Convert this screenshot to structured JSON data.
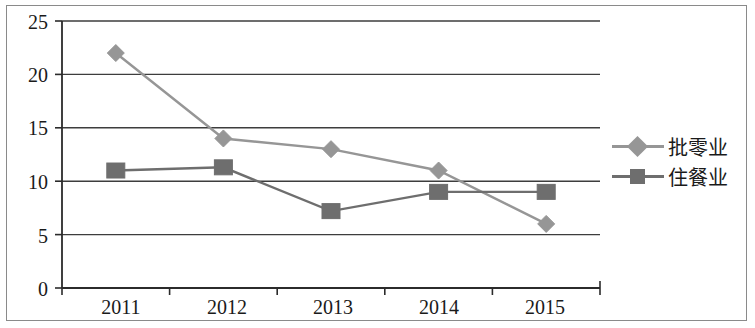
{
  "chart_data": {
    "type": "line",
    "title": "",
    "subtitle": "",
    "xlabel": "",
    "ylabel": "",
    "categories": [
      "2011",
      "2012",
      "2013",
      "2014",
      "2015"
    ],
    "ylim": [
      0,
      25
    ],
    "yticks": [
      "0",
      "5",
      "10",
      "15",
      "20",
      "25"
    ],
    "ytick_values": [
      0,
      5,
      10,
      15,
      20,
      25
    ],
    "grid": true,
    "grid_axis": "y",
    "legend_position": "right",
    "series": [
      {
        "name": "批零业",
        "marker": "diamond",
        "color": "#969696",
        "values": [
          22,
          14,
          13,
          11,
          6
        ]
      },
      {
        "name": "住餐业",
        "marker": "square",
        "color": "#6e6e6e",
        "values": [
          11,
          11.3,
          7.2,
          9,
          9
        ]
      }
    ]
  },
  "legend": {
    "items": [
      {
        "label": "批零业",
        "marker": "diamond-marker-icon"
      },
      {
        "label": "住餐业",
        "marker": "square-marker-icon"
      }
    ]
  },
  "axes": {
    "y_tick_labels": [
      "25",
      "20",
      "15",
      "10",
      "5",
      "0"
    ],
    "x_tick_labels": [
      "2011",
      "2012",
      "2013",
      "2014",
      "2015"
    ]
  },
  "colors": {
    "series1": "#969696",
    "series2": "#6e6e6e",
    "grid": "#3d3d3d",
    "axis": "#2b2b2b",
    "frame": "#8a8a8a",
    "text": "#1a1a1a",
    "background": "#ffffff"
  }
}
